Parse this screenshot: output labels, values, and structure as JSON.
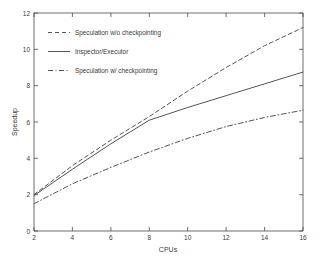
{
  "chart_data": {
    "type": "line",
    "title": "",
    "xlabel": "CPUs",
    "ylabel": "Speedup",
    "xlim": [
      2,
      16
    ],
    "ylim": [
      0,
      12
    ],
    "xticks": [
      "2",
      "4",
      "6",
      "8",
      "10",
      "12",
      "14",
      "16"
    ],
    "yticks": [
      "0",
      "2",
      "4",
      "6",
      "8",
      "10",
      "12"
    ],
    "grid": false,
    "legend_position": "upper-left-inside",
    "x": [
      2,
      4,
      6,
      8,
      10,
      12,
      14,
      16
    ],
    "series": [
      {
        "name": "Speculation w/o checkpointing",
        "style": "dashed",
        "color": "#555555",
        "values": [
          2.0,
          3.6,
          5.0,
          6.3,
          7.7,
          9.0,
          10.2,
          11.2
        ]
      },
      {
        "name": "Inspector/Executor",
        "style": "solid",
        "color": "#555555",
        "values": [
          1.95,
          3.4,
          4.8,
          6.1,
          6.8,
          7.45,
          8.1,
          8.75
        ]
      },
      {
        "name": "Speculation w/ checkpointing",
        "style": "dash-dot",
        "color": "#555555",
        "values": [
          1.5,
          2.6,
          3.5,
          4.35,
          5.1,
          5.75,
          6.25,
          6.65
        ]
      }
    ]
  },
  "axes": {
    "x_label": "CPUs",
    "y_label": "Speedup",
    "x_tick_labels": [
      "2",
      "4",
      "6",
      "8",
      "10",
      "12",
      "14",
      "16"
    ],
    "y_tick_labels": [
      "0",
      "2",
      "4",
      "6",
      "8",
      "10",
      "12"
    ]
  },
  "legend": {
    "entries": [
      {
        "label": "Speculation w/o checkpointing",
        "style": "dashed"
      },
      {
        "label": "Inspector/Executor",
        "style": "solid"
      },
      {
        "label": "Speculation w/ checkpointing",
        "style": "dash-dot"
      }
    ]
  },
  "colors": {
    "line": "#555555",
    "axis": "#4a4a4a",
    "text": "#3a3a3a",
    "background": "#ffffff"
  }
}
